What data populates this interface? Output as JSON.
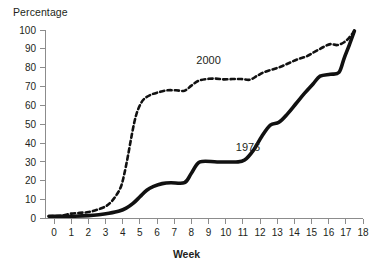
{
  "chart_data": {
    "type": "line",
    "title": "",
    "xlabel": "Week",
    "ylabel": "Percentage",
    "xlim": [
      -0.5,
      18
    ],
    "ylim": [
      0,
      100
    ],
    "grid": false,
    "legend_position": "inline-annotation",
    "x_ticks": [
      "0",
      "1",
      "2",
      "3",
      "4",
      "5",
      "6",
      "7",
      "8",
      "9",
      "10",
      "11",
      "12",
      "13",
      "14",
      "15",
      "16",
      "17",
      "18"
    ],
    "y_ticks": [
      "0",
      "10",
      "20",
      "30",
      "40",
      "50",
      "60",
      "70",
      "80",
      "90",
      "100"
    ],
    "series": [
      {
        "name": "2000",
        "style": "dashed",
        "color": "#111111",
        "label_x": 9.0,
        "label_y": 82,
        "points": [
          [
            -0.3,
            1.2
          ],
          [
            0.0,
            1.3
          ],
          [
            0.5,
            1.6
          ],
          [
            1.0,
            2.6
          ],
          [
            1.5,
            3.0
          ],
          [
            2.0,
            3.4
          ],
          [
            2.5,
            4.6
          ],
          [
            3.0,
            6.4
          ],
          [
            3.3,
            8.6
          ],
          [
            3.6,
            12.0
          ],
          [
            3.9,
            17.0
          ],
          [
            4.1,
            24.0
          ],
          [
            4.3,
            33.0
          ],
          [
            4.5,
            43.0
          ],
          [
            4.7,
            52.0
          ],
          [
            4.9,
            58.0
          ],
          [
            5.2,
            63.0
          ],
          [
            5.6,
            65.5
          ],
          [
            6.1,
            67.0
          ],
          [
            6.6,
            68.0
          ],
          [
            7.1,
            68.0
          ],
          [
            7.6,
            67.8
          ],
          [
            8.0,
            70.5
          ],
          [
            8.4,
            73.0
          ],
          [
            8.9,
            74.0
          ],
          [
            9.4,
            74.2
          ],
          [
            9.9,
            73.8
          ],
          [
            10.4,
            74.0
          ],
          [
            10.9,
            74.0
          ],
          [
            11.4,
            73.6
          ],
          [
            11.8,
            75.5
          ],
          [
            12.2,
            77.5
          ],
          [
            12.7,
            79.0
          ],
          [
            13.2,
            80.5
          ],
          [
            13.7,
            82.5
          ],
          [
            14.2,
            84.5
          ],
          [
            14.7,
            86.0
          ],
          [
            15.2,
            88.5
          ],
          [
            15.7,
            91.0
          ],
          [
            16.1,
            92.5
          ],
          [
            16.5,
            92.0
          ],
          [
            16.9,
            93.5
          ],
          [
            17.2,
            96.0
          ],
          [
            17.5,
            99.5
          ]
        ]
      },
      {
        "name": "1976",
        "style": "solid",
        "color": "#111111",
        "label_x": 11.3,
        "label_y": 36,
        "points": [
          [
            -0.3,
            1.2
          ],
          [
            0.5,
            1.2
          ],
          [
            1.2,
            1.2
          ],
          [
            2.0,
            1.5
          ],
          [
            2.6,
            2.0
          ],
          [
            3.2,
            2.8
          ],
          [
            3.8,
            4.0
          ],
          [
            4.2,
            5.5
          ],
          [
            4.6,
            8.0
          ],
          [
            5.0,
            11.5
          ],
          [
            5.4,
            15.0
          ],
          [
            5.8,
            17.0
          ],
          [
            6.3,
            18.5
          ],
          [
            6.8,
            19.0
          ],
          [
            7.6,
            19.0
          ],
          [
            8.0,
            24.0
          ],
          [
            8.5,
            30.0
          ],
          [
            9.5,
            30.0
          ],
          [
            10.6,
            30.0
          ],
          [
            11.1,
            31.0
          ],
          [
            11.6,
            36.0
          ],
          [
            12.1,
            43.5
          ],
          [
            12.6,
            49.5
          ],
          [
            13.1,
            51.0
          ],
          [
            13.6,
            55.5
          ],
          [
            14.1,
            61.0
          ],
          [
            14.6,
            66.5
          ],
          [
            15.1,
            71.5
          ],
          [
            15.5,
            75.5
          ],
          [
            16.1,
            76.5
          ],
          [
            16.6,
            77.5
          ],
          [
            16.9,
            85.0
          ],
          [
            17.2,
            92.0
          ],
          [
            17.5,
            99.5
          ]
        ]
      }
    ]
  }
}
